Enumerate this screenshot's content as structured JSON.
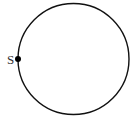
{
  "diagram": {
    "type": "circle-with-point",
    "circle": {
      "cx": 73.5,
      "cy": 59,
      "r": 55.5,
      "stroke": "#111111"
    },
    "point": {
      "label": "S",
      "x": 18,
      "y": 59,
      "color": "#000000"
    }
  }
}
